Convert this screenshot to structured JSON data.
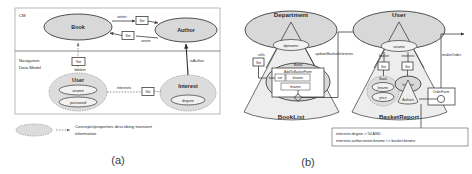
{
  "figure": {
    "panel_a_caption": "(a)",
    "panel_b_caption": "(b)"
  },
  "panel_a": {
    "sections": [
      {
        "label": "CM"
      },
      {
        "label_line1": "Navigation",
        "label_line2": "Data Model"
      }
    ],
    "nodes": [
      {
        "name": "Book",
        "kind": "concept"
      },
      {
        "name": "Author",
        "kind": "concept"
      },
      {
        "name": "User",
        "kind": "transient",
        "properties": [
          "uname",
          "password"
        ]
      },
      {
        "name": "Interest",
        "kind": "transient",
        "properties": [
          "degree"
        ]
      }
    ],
    "set_box_label": "Set",
    "edges": [
      {
        "label": "writer",
        "from": "Book",
        "to": "Author"
      },
      {
        "label": "wrote",
        "from": "Author",
        "to": "Book"
      },
      {
        "label": "basket",
        "from": "User",
        "to": "Book"
      },
      {
        "label": "interests",
        "from": "User",
        "to": "Interest"
      },
      {
        "label": "isAuthor",
        "from": "Interest",
        "to": "Author"
      }
    ],
    "legend": {
      "line1": "Concepts/properties describing transient",
      "line2": "information"
    }
  },
  "panel_b": {
    "cones": [
      {
        "head": "Department",
        "head_property": "dptname",
        "base_label": "BookList"
      },
      {
        "head": "User",
        "head_property": "uname",
        "base_label": "BasketReport"
      }
    ],
    "set_box_label": "Set",
    "edge_labels": [
      "sells",
      "basket",
      "interests"
    ],
    "link_labels": [
      "updateBasketInterests",
      "makeOrder"
    ],
    "booklist": {
      "outer_node": "Book",
      "form_title": "AddToBasketForm",
      "form_rows": [
        {
          "col1": "set",
          "col2": "bname"
        },
        {
          "col1": "",
          "col2": "bname"
        }
      ]
    },
    "basketreport": {
      "book_node": "Book",
      "book_properties": [
        "bname",
        "price"
      ],
      "interest_node": "Interest",
      "interest_property": "Authors",
      "order_form": "OrderForm"
    },
    "constraint": {
      "line1": "interests.degree > 50  AND",
      "line2": "interests.author.wrote.bname <> basket.bname"
    }
  },
  "colors": {
    "node_fill": "#d8d8d8",
    "prop_fill": "#f2f2f2",
    "cone_fill": "#ededed",
    "stroke": "#3d3d3d",
    "transient_stroke": "#8a8a8a"
  }
}
